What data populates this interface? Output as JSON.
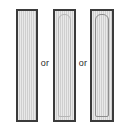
{
  "diagram": {
    "connector_label": "or",
    "background_color": "#ffffff",
    "outline_color": "#3b3b3b",
    "fill_color": "#cfcfcf",
    "options": [
      {
        "id": "column-plain",
        "label": "",
        "inner_outline": "none",
        "fill": "hatched-grey"
      },
      {
        "id": "column-inner-light",
        "label": "",
        "inner_outline": "light",
        "inner_outline_color": "#b6b6b6",
        "fill": "hatched-grey"
      },
      {
        "id": "column-inner-dark",
        "label": "",
        "inner_outline": "dark",
        "inner_outline_color": "#8d8d8d",
        "fill": "hatched-grey"
      }
    ],
    "connectors": [
      {
        "id": "or-1",
        "text": "or"
      },
      {
        "id": "or-2",
        "text": "or"
      }
    ]
  }
}
